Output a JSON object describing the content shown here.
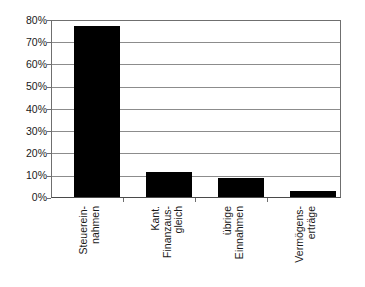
{
  "chart_data": {
    "type": "bar",
    "title": "",
    "subtitle": "",
    "xlabel": "",
    "ylabel": "",
    "ylim": [
      0,
      80
    ],
    "ytick_values": [
      0,
      10,
      20,
      30,
      40,
      50,
      60,
      70,
      80
    ],
    "ytick_labels": [
      "0%",
      "10%",
      "20%",
      "30%",
      "40%",
      "50%",
      "60%",
      "70%",
      "80%"
    ],
    "grid": true,
    "legend": false,
    "legend_position": "none",
    "bar_color": "#000000",
    "categories": [
      "Steuerein-nahmen",
      "Kant. Finanzaus-gleich",
      "übrige Einnahmen",
      "Vermögens-erträge"
    ],
    "category_lines": [
      [
        "Steuerein-",
        "nahmen"
      ],
      [
        "Kant.",
        "Finanzaus-",
        "gleich"
      ],
      [
        "übrige",
        "Einnahmen"
      ],
      [
        "Vermögens-",
        "erträge"
      ]
    ],
    "values": [
      77.7,
      11.5,
      8.5,
      2.7
    ],
    "value_unit": "%"
  },
  "axis": {
    "y": {
      "ticks": [
        {
          "label": "80%",
          "value": 80
        },
        {
          "label": "70%",
          "value": 70
        },
        {
          "label": "60%",
          "value": 60
        },
        {
          "label": "50%",
          "value": 50
        },
        {
          "label": "40%",
          "value": 40
        },
        {
          "label": "30%",
          "value": 30
        },
        {
          "label": "20%",
          "value": 20
        },
        {
          "label": "10%",
          "value": 10
        },
        {
          "label": "0%",
          "value": 0
        }
      ]
    },
    "x": {
      "labels": [
        {
          "l0": "Steuerein-",
          "l1": "nahmen",
          "l2": ""
        },
        {
          "l0": "Kant.",
          "l1": "Finanzaus-",
          "l2": "gleich"
        },
        {
          "l0": "übrige",
          "l1": "Einnahmen",
          "l2": ""
        },
        {
          "l0": "Vermögens-",
          "l1": "erträge",
          "l2": ""
        }
      ]
    }
  }
}
